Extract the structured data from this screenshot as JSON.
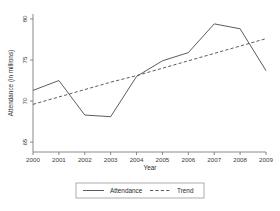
{
  "chart_data": {
    "type": "line",
    "title": "",
    "xlabel": "Year",
    "ylabel": "Attendance (in millions)",
    "x": [
      2000,
      2001,
      2002,
      2003,
      2004,
      2005,
      2006,
      2007,
      2008,
      2009
    ],
    "xtick_labels": [
      "2000",
      "2001",
      "2002",
      "2003",
      "2004",
      "2005",
      "2006",
      "2007",
      "2008",
      "2009"
    ],
    "ytick_labels": [
      "65",
      "70",
      "75",
      "80"
    ],
    "yticks": [
      65,
      70,
      75,
      80
    ],
    "xlim": [
      2000,
      2009
    ],
    "ylim": [
      63.8,
      80.6
    ],
    "grid": false,
    "legend_position": "bottom-center",
    "series": [
      {
        "name": "Attendance",
        "style": "solid",
        "color": "#4a4a4a",
        "values": [
          71.3,
          72.5,
          68.3,
          68.1,
          73.0,
          74.9,
          75.9,
          79.4,
          78.8,
          73.7
        ]
      },
      {
        "name": "Trend",
        "style": "dashed",
        "color": "#4a4a4a",
        "values": [
          69.6,
          70.5,
          71.4,
          72.3,
          73.1,
          74.0,
          74.9,
          75.8,
          76.7,
          77.6
        ]
      }
    ],
    "legend": [
      {
        "label": "Attendance",
        "style": "solid"
      },
      {
        "label": "Trend",
        "style": "dashed"
      }
    ]
  }
}
